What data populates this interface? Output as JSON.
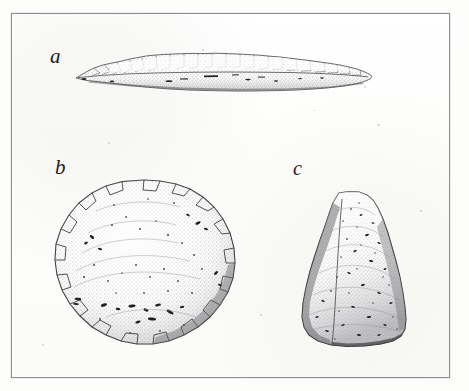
{
  "page": {
    "kind": "book-plate-scan",
    "background_color": "#fdfdfc",
    "plate_background_color": "#fefefd",
    "frame_color": "#8d8f93",
    "ink_color": "#1b1b1b",
    "width": 469,
    "height": 391
  },
  "header": {
    "ghost_text_left": "",
    "ghost_text_right": ""
  },
  "plate": {
    "figures": [
      {
        "label": "a",
        "name": "chipped-stone-blade",
        "description": "long slender flaked stone blade shown in edge profile",
        "orientation": "horizontal",
        "label_position": {
          "x": 38,
          "y": 32
        },
        "bounds": {
          "x": 60,
          "y": 34,
          "width": 302,
          "height": 50
        }
      },
      {
        "label": "b",
        "name": "round-stone-disc",
        "description": "roughly circular pitted stone disc seen face-on",
        "orientation": "circular",
        "label_position": {
          "x": 43,
          "y": 143
        },
        "bounds": {
          "x": 36,
          "y": 163,
          "width": 198,
          "height": 190
        }
      },
      {
        "label": "c",
        "name": "domed-stone-celt",
        "description": "bell shaped ground stone celt with rounded top and flat base",
        "orientation": "vertical",
        "label_position": {
          "x": 281,
          "y": 144
        },
        "bounds": {
          "x": 281,
          "y": 175,
          "width": 122,
          "height": 168
        }
      }
    ]
  }
}
